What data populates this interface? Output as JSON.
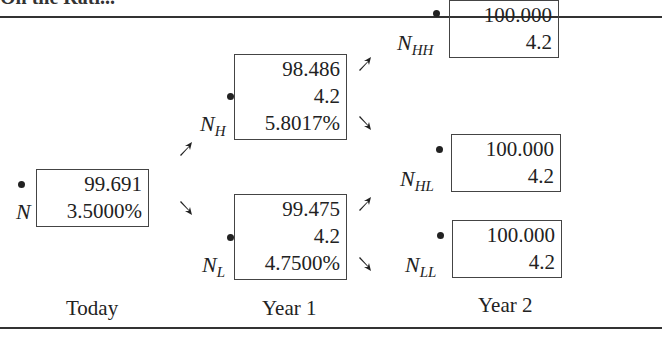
{
  "header": {
    "cut_text": "On the Rati..."
  },
  "nodes": {
    "N": {
      "label": "N",
      "sub": "",
      "values": [
        "99.691",
        "3.5000%"
      ]
    },
    "NH": {
      "label": "N",
      "sub": "H",
      "values": [
        "98.486",
        "4.2",
        "5.8017%"
      ]
    },
    "NL": {
      "label": "N",
      "sub": "L",
      "values": [
        "99.475",
        "4.2",
        "4.7500%"
      ]
    },
    "NHH": {
      "label": "N",
      "sub": "HH",
      "values": [
        "100.000",
        "4.2"
      ]
    },
    "NHL": {
      "label": "N",
      "sub": "HL",
      "values": [
        "100.000",
        "4.2"
      ]
    },
    "NLL": {
      "label": "N",
      "sub": "LL",
      "values": [
        "100.000",
        "4.2"
      ]
    }
  },
  "time_labels": [
    "Today",
    "Year 1",
    "Year 2"
  ]
}
